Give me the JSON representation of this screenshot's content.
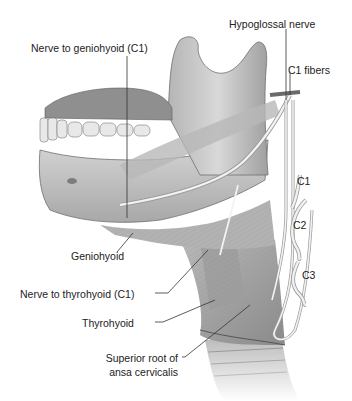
{
  "figure": {
    "colors": {
      "background": "#ffffff",
      "bone": "#c9c9c9",
      "bone_shadow": "#8f8f8f",
      "muscle": "#a9a9a9",
      "muscle_dark": "#7d7d7d",
      "nerve": "#f0f0f0",
      "nerve_outline": "#9a9a9a",
      "leader_line": "#333333",
      "label_text": "#222222"
    },
    "labels": {
      "hypoglossal_nerve": "Hypoglossal nerve",
      "nerve_to_geniohyoid": "Nerve to geniohyoid (C1)",
      "c1_fibers": "C1 fibers",
      "c1": "C1",
      "c2": "C2",
      "c3": "C3",
      "geniohyoid": "Geniohyoid",
      "nerve_to_thyrohyoid": "Nerve to thyrohyoid (C1)",
      "thyrohyoid": "Thyrohyoid",
      "superior_root_line1": "Superior root of",
      "superior_root_line2": "ansa cervicalis"
    }
  }
}
